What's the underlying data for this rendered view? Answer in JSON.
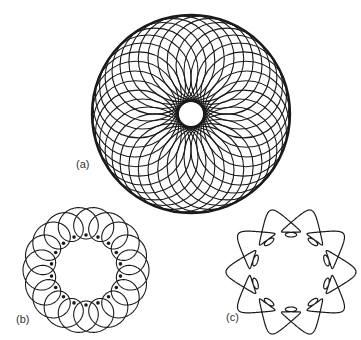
{
  "figures": [
    {
      "id": "a",
      "label": "(a)",
      "kind": "circle-rosette",
      "center": [
        191,
        114
      ],
      "outer_radius": 99,
      "inner_radius": 13,
      "circle_count": 36,
      "label_pos": [
        76,
        159
      ]
    },
    {
      "id": "b",
      "label": "(b)",
      "kind": "looped-ring",
      "center": [
        86,
        270
      ],
      "ring_radius": 47,
      "loop_radius": 16,
      "loop_count": 18,
      "label_pos": [
        16,
        314
      ]
    },
    {
      "id": "c",
      "label": "(c)",
      "kind": "lobed-loop-ring",
      "center": [
        291,
        272
      ],
      "lobe_count": 10,
      "label_pos": [
        226,
        312
      ]
    }
  ],
  "colors": {
    "stroke": "#1a1a1a",
    "background": "#ffffff",
    "label": "#333333"
  }
}
